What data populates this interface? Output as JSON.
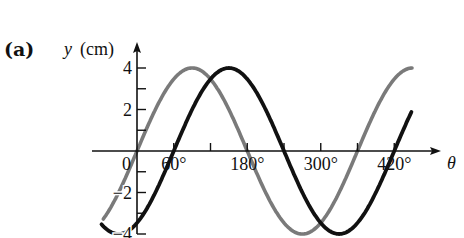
{
  "chart_data": {
    "type": "line",
    "panel_label": "(a)",
    "title": "",
    "xlabel": "θ",
    "ylabel": "y (cm)",
    "ylabel_var": "y",
    "ylabel_unit": "(cm)",
    "x_unit": "degrees",
    "xlim": [
      -60,
      450
    ],
    "ylim": [
      -4,
      4
    ],
    "grid": false,
    "legend": null,
    "x_ticks": [
      0,
      60,
      120,
      180,
      240,
      300,
      360,
      420
    ],
    "x_tick_labels": [
      {
        "value": 0,
        "label": "0"
      },
      {
        "value": 60,
        "label": "60°"
      },
      {
        "value": 180,
        "label": "180°"
      },
      {
        "value": 300,
        "label": "300°"
      },
      {
        "value": 420,
        "label": "420°"
      }
    ],
    "y_ticks": [
      -4,
      -3,
      -2,
      -1,
      1,
      2,
      3,
      4
    ],
    "y_tick_labels": [
      {
        "value": 4,
        "label": "4"
      },
      {
        "value": 2,
        "label": "2"
      },
      {
        "value": -2,
        "label": "−2"
      },
      {
        "value": -4,
        "label": "−4"
      }
    ],
    "series": [
      {
        "name": "gray wave",
        "color": "#7a7a7a",
        "formula": "y = 4 sin(θ)",
        "amplitude": 4,
        "phase_shift_deg": 0,
        "x_range": [
          -55,
          450
        ],
        "zero_crossings": [
          0,
          180,
          360
        ],
        "peak_at": [
          90,
          450
        ],
        "trough_at": [
          270
        ]
      },
      {
        "name": "black wave",
        "color": "#111111",
        "formula": "y = 4 sin(θ − 60°)",
        "amplitude": 4,
        "phase_shift_deg": 60,
        "x_range": [
          -58,
          448
        ],
        "zero_crossings": [
          60,
          240,
          420
        ],
        "peak_at": [
          150
        ],
        "trough_at": [
          -30,
          330
        ]
      }
    ]
  }
}
